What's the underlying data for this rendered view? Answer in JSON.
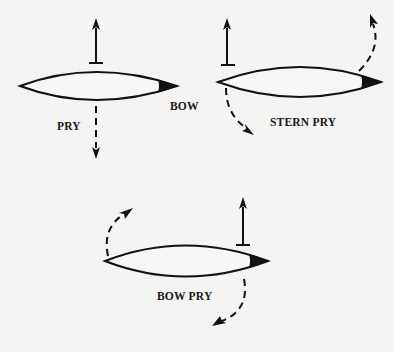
{
  "diagram": {
    "colors": {
      "background": "#f4f4f2",
      "ink": "#111111",
      "hull_fill": "#f7f7f5"
    },
    "panels": [
      {
        "id": "pry",
        "title": "PRY",
        "extra_label": "BOW",
        "elements": [
          "canoe-hull",
          "bow-marker",
          "force-arrow-up",
          "dashed-arrow-down"
        ]
      },
      {
        "id": "stern-pry",
        "title": "STERN PRY",
        "elements": [
          "canoe-hull",
          "bow-marker",
          "force-arrow-up",
          "dashed-curve-stern-down",
          "dashed-curve-bow-up"
        ]
      },
      {
        "id": "bow-pry",
        "title": "BOW PRY",
        "elements": [
          "canoe-hull",
          "bow-marker",
          "force-arrow-up",
          "dashed-curve-stern-up",
          "dashed-curve-bow-down"
        ]
      }
    ]
  },
  "labels": {
    "pry": "PRY",
    "bow": "BOW",
    "stern_pry": "STERN PRY",
    "bow_pry": "BOW PRY"
  }
}
